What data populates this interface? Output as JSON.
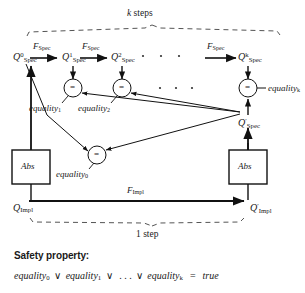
{
  "diagram": {
    "title_alt": "k-step induction commuting diagram",
    "top_bracket_label": "k steps",
    "bottom_bracket_label": "1 step",
    "spec_states": [
      {
        "name": "Q0-spec",
        "base": "Q",
        "sup": "0",
        "subs": "Spec"
      },
      {
        "name": "Q1-spec",
        "base": "Q",
        "sup": "1",
        "subs": "Spec"
      },
      {
        "name": "Q2-spec",
        "base": "Q",
        "sup": "2",
        "subs": "Spec"
      },
      {
        "name": "Qk-spec",
        "base": "Q",
        "sup": "k",
        "subs": "Spec"
      }
    ],
    "spec_prime_state": {
      "base": "Q",
      "sup": "′",
      "subs": "Spec"
    },
    "transition_labels": [
      {
        "base": "F",
        "subs": "Spec"
      },
      {
        "base": "F",
        "subs": "Spec"
      },
      {
        "base": "F",
        "subs": "Spec"
      }
    ],
    "impl_transition_label": {
      "base": "F",
      "subs": "Impl"
    },
    "impl_state_left": {
      "base": "Q",
      "sup": "",
      "subs": "Impl"
    },
    "impl_state_right": {
      "base": "Q",
      "sup": "′",
      "subs": "Impl"
    },
    "abs_boxes": [
      {
        "name": "abs-left",
        "label": "Abs"
      },
      {
        "name": "abs-right",
        "label": "Abs"
      }
    ],
    "comparator_symbol": "=",
    "equalities": [
      {
        "name": "equality-0",
        "base": "equality",
        "subs": "0"
      },
      {
        "name": "equality-1",
        "base": "equality",
        "subs": "1"
      },
      {
        "name": "equality-2",
        "base": "equality",
        "subs": "2"
      },
      {
        "name": "equality-k",
        "base": "equality",
        "subs": "k"
      }
    ],
    "ellipsis_dots": "· · ·"
  },
  "safety": {
    "heading": "Safety property:",
    "terms": [
      {
        "base": "equality",
        "subs": "0"
      },
      {
        "base": "equality",
        "subs": "1"
      },
      {
        "base": "equality",
        "subs": "k"
      }
    ],
    "or_symbol": "∨",
    "ellipsis": ". . .",
    "equals_symbol": "=",
    "result": "true"
  },
  "colors": {
    "ink": "#1a1a1a",
    "line": "#111111",
    "dashed": "#555555",
    "background": "#ffffff"
  }
}
